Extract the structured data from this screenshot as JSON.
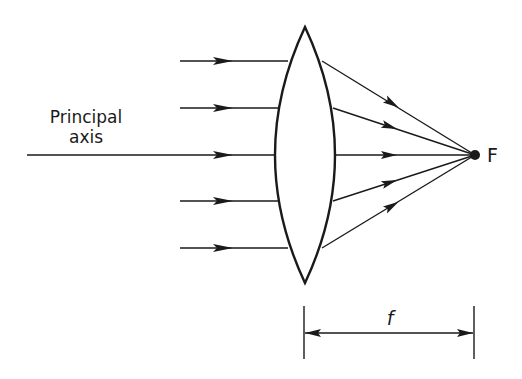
{
  "diagram": {
    "labels": {
      "principal_axis_line1": "Principal",
      "principal_axis_line2": "axis",
      "focal_point": "F",
      "focal_length": "f"
    },
    "colors": {
      "stroke": "#1a1a1a",
      "background": "#ffffff"
    },
    "incident_rays_y": [
      61,
      108,
      155,
      201,
      248
    ]
  }
}
